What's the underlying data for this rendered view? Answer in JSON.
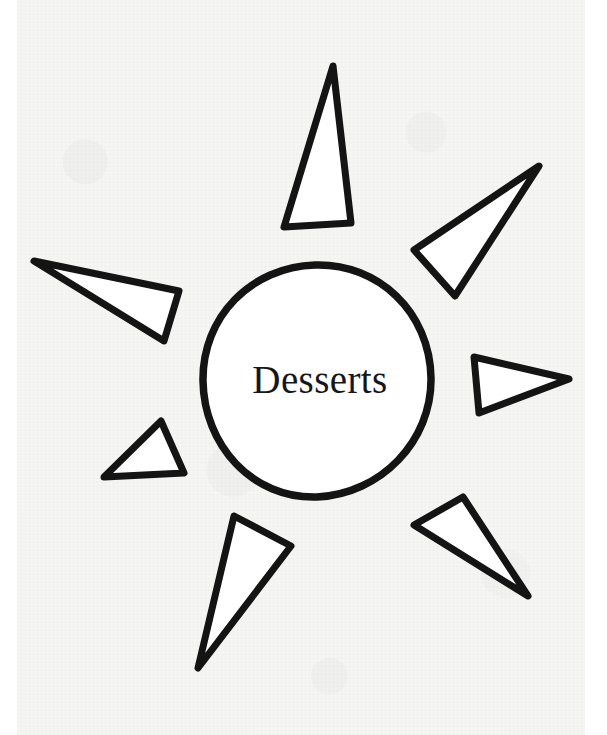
{
  "page": {
    "kind": "hand-drawn-sun-diagram-worksheet",
    "width": 607,
    "height": 735,
    "background_color": "#f5f5f3",
    "margin_color": "#ffffff",
    "ink_color": "#141414"
  },
  "diagram": {
    "title": "Desserts",
    "center_label": "Desserts",
    "shape_name": "sun-graphic-organizer",
    "hub": {
      "label": "Desserts",
      "center_x": 315,
      "center_y": 381,
      "radius": 115,
      "fill": "#ffffff",
      "stroke": "#141414"
    },
    "ray_count": 7,
    "rays": [
      {
        "id": "ray-top",
        "name": "ray-top",
        "label": "",
        "direction": "up",
        "points": "333,66 284,227 351,223"
      },
      {
        "id": "ray-top-right",
        "name": "ray-top-right",
        "label": "",
        "direction": "up-right",
        "points": "539,166 414,250 455,296"
      },
      {
        "id": "ray-right",
        "name": "ray-right",
        "label": "",
        "direction": "right",
        "points": "569,379 474,357 479,413"
      },
      {
        "id": "ray-bottom-right",
        "name": "ray-bottom-right",
        "label": "",
        "direction": "down-right",
        "points": "528,596 414,525 463,497"
      },
      {
        "id": "ray-bottom",
        "name": "ray-bottom",
        "label": "",
        "direction": "down-left",
        "points": "198,668 234,516 291,546"
      },
      {
        "id": "ray-bottom-left",
        "name": "ray-bottom-left",
        "label": "",
        "direction": "left-down",
        "points": "104,477 161,421 184,473"
      },
      {
        "id": "ray-left",
        "name": "ray-left",
        "label": "",
        "direction": "left",
        "points": "34,261 179,291 164,341"
      }
    ]
  }
}
